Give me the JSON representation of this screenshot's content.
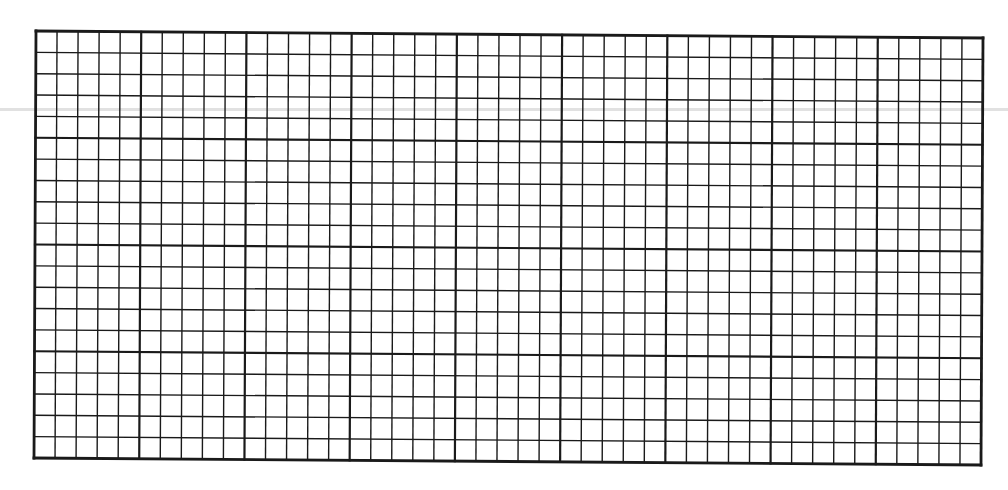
{
  "page": {
    "background": "#ffffff"
  },
  "grid": {
    "major_columns": 9,
    "major_rows": 4,
    "minor_per_major": 5,
    "corners": {
      "top_left": [
        36,
        31
      ],
      "top_right": [
        983,
        38
      ],
      "bottom_right": [
        981,
        465
      ],
      "bottom_left": [
        34,
        458
      ]
    },
    "line_color": "#1a1a1a",
    "minor_stroke": 1.4,
    "major_stroke": 2.2,
    "border_stroke": 2.8
  },
  "artifacts": {
    "scan_line_y": 109,
    "scan_line_color": "#d9d9d9"
  }
}
